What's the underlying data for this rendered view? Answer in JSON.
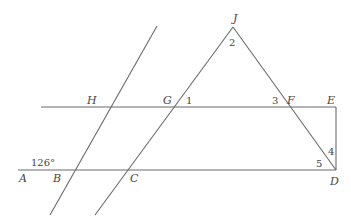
{
  "diagram": {
    "type": "geometry",
    "points": [
      {
        "label": "J",
        "x": 233,
        "y": 22
      },
      {
        "label": "H",
        "x": 87,
        "y": 104
      },
      {
        "label": "G",
        "x": 163,
        "y": 104
      },
      {
        "label": "F",
        "x": 287,
        "y": 104
      },
      {
        "label": "E",
        "x": 327,
        "y": 104
      },
      {
        "label": "A",
        "x": 19,
        "y": 182
      },
      {
        "label": "B",
        "x": 53,
        "y": 182
      },
      {
        "label": "C",
        "x": 130,
        "y": 182
      },
      {
        "label": "D",
        "x": 330,
        "y": 185
      }
    ],
    "angles": [
      {
        "label": "2",
        "x": 229,
        "y": 46
      },
      {
        "label": "1",
        "x": 186,
        "y": 104
      },
      {
        "label": "3",
        "x": 272,
        "y": 104
      },
      {
        "label": "4",
        "x": 328,
        "y": 155
      },
      {
        "label": "5",
        "x": 316,
        "y": 167
      },
      {
        "label": "126°",
        "x": 31,
        "y": 166
      }
    ],
    "lines": [
      {
        "name": "line-HE",
        "x1": 41,
        "y1": 107,
        "x2": 336,
        "y2": 107
      },
      {
        "name": "line-AD",
        "x1": 18,
        "y1": 170,
        "x2": 336,
        "y2": 170
      },
      {
        "name": "segment-ED",
        "x1": 336,
        "y1": 107,
        "x2": 336,
        "y2": 170
      },
      {
        "name": "line-HB",
        "x1": 50,
        "y1": 215,
        "x2": 157,
        "y2": 26
      },
      {
        "name": "line-JC",
        "x1": 95,
        "y1": 215,
        "x2": 233,
        "y2": 27
      },
      {
        "name": "line-JD",
        "x1": 233,
        "y1": 27,
        "x2": 336,
        "y2": 170
      }
    ]
  }
}
